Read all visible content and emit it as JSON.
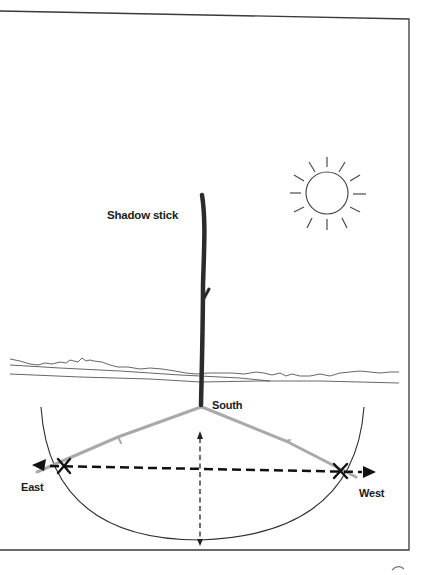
{
  "figure": {
    "labels": {
      "stick": "Shadow stick",
      "south": "South",
      "east": "East",
      "west": "West"
    },
    "colors": {
      "frame": "#3a3a3a",
      "stick": "#2b2b2b",
      "shadow": "#a9a9a9",
      "arc": "#2f2f2f",
      "arrow": "#111111",
      "sun": "#4a4a4a",
      "horizon": "#555555"
    },
    "elements": [
      "sun-icon",
      "shadow-stick",
      "horizon-lines",
      "shadow-arc",
      "shadow-line-east",
      "shadow-line-west",
      "east-west-dashed-arrow",
      "north-south-dashed-arrow",
      "x-mark-east",
      "x-mark-west"
    ]
  }
}
